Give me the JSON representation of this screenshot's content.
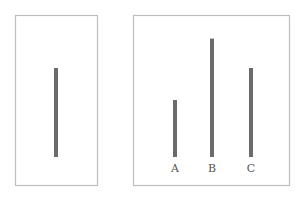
{
  "figure": {
    "reference_card": {
      "lines": [
        {
          "label": "",
          "relative_length": 1.0
        }
      ]
    },
    "comparison_card": {
      "lines": [
        {
          "label": "A",
          "relative_length": 0.64
        },
        {
          "label": "B",
          "relative_length": 1.33
        },
        {
          "label": "C",
          "relative_length": 1.0
        }
      ]
    },
    "colors": {
      "line": "#6b6b6b",
      "frame": "#bdbdbd",
      "label": "#555555"
    }
  }
}
